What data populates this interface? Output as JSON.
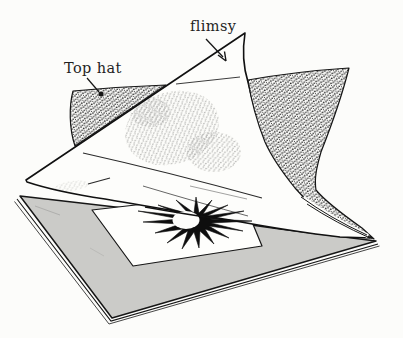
{
  "figure": {
    "labels": {
      "top_hat": "Top hat",
      "flimsy": "flimsy"
    },
    "colors": {
      "ink": "#161616",
      "board_gray": "#cbcbc8",
      "paper": "#fdfdfb",
      "background": "#fcfcfa"
    }
  }
}
